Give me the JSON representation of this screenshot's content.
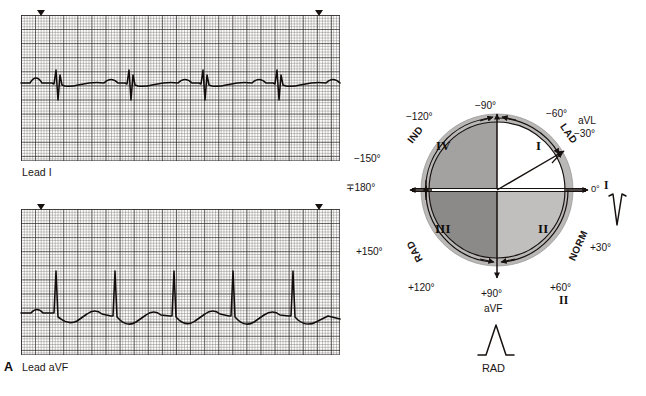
{
  "figure": {
    "panel_letter": "A",
    "domain": "medical-ecg-axis-diagram"
  },
  "ecg_strips": [
    {
      "id": "lead-1",
      "caption": "Lead I",
      "lead_name": "Lead I",
      "polarity": "negative",
      "description": "Predominantly negative QRS complexes (deep S waves) in Lead I",
      "beat_count": 4,
      "marker_count": 2
    },
    {
      "id": "lead-avf",
      "caption": "Lead aVF",
      "lead_name": "Lead aVF",
      "polarity": "positive",
      "description": "Predominantly positive QRS complexes (tall R waves) in Lead aVF",
      "beat_count": 4,
      "marker_count": 2
    }
  ],
  "axis_diagram": {
    "center_label": "hexaxial reference circle",
    "degree_labels": [
      {
        "text": "−90°",
        "angle": -90
      },
      {
        "text": "−120°",
        "angle": -120
      },
      {
        "text": "−150°",
        "angle": -150
      },
      {
        "text": "∓180°",
        "angle": 180
      },
      {
        "text": "+150°",
        "angle": 150
      },
      {
        "text": "+120°",
        "angle": 120
      },
      {
        "text": "+90°",
        "angle": 90
      },
      {
        "text": "+60°",
        "angle": 60
      },
      {
        "text": "+30°",
        "angle": 30
      },
      {
        "text": "0°",
        "angle": 0
      },
      {
        "text": "−30°",
        "angle": -30
      },
      {
        "text": "−60°",
        "angle": -60
      }
    ],
    "lead_labels": [
      {
        "text": "aVL",
        "at_degree": "−30°"
      },
      {
        "text": "I",
        "at_degree": "0°"
      },
      {
        "text": "II",
        "at_degree": "+60°"
      },
      {
        "text": "aVF",
        "at_degree": "+90°"
      }
    ],
    "quadrants": [
      {
        "numeral": "I",
        "position": "upper-right",
        "fill": "#ffffff"
      },
      {
        "numeral": "II",
        "position": "lower-right",
        "fill": "#c0bfbd"
      },
      {
        "numeral": "III",
        "position": "lower-left",
        "fill": "#8b8a88"
      },
      {
        "numeral": "IV",
        "position": "upper-left",
        "fill": "#a3a2a0"
      }
    ],
    "zones": [
      {
        "abbr": "IND",
        "meaning": "indeterminate axis",
        "arc": "upper-left"
      },
      {
        "abbr": "LAD",
        "meaning": "left axis deviation",
        "arc": "upper-right"
      },
      {
        "abbr": "NORM",
        "meaning": "normal axis",
        "arc": "lower-right"
      },
      {
        "abbr": "RAD",
        "meaning": "right axis deviation",
        "arc": "lower-left"
      }
    ],
    "vector": {
      "label": "mean QRS axis vector",
      "points_to": "−30°"
    },
    "qrs_glyphs": [
      {
        "id": "qrs-lead-1",
        "lead": "I",
        "deflection": "negative",
        "caption": ""
      },
      {
        "id": "qrs-lead-avf",
        "lead": "aVF",
        "deflection": "positive",
        "caption": "RAD"
      }
    ],
    "conclusion_label": "RAD"
  },
  "colors": {
    "quadrant_1": "#ffffff",
    "quadrant_2": "#c0bfbd",
    "quadrant_3": "#8b8a88",
    "quadrant_4": "#a3a2a0",
    "outer_ring": "#b9b8b6",
    "ink": "#17110f",
    "grid_major": "#282222",
    "grid_minor": "#5a5050"
  }
}
